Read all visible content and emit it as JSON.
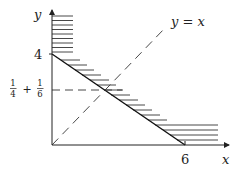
{
  "diagram": {
    "axes": {
      "x_label": "x",
      "y_label": "y"
    },
    "ticks": {
      "y_tick": "4",
      "x_tick": "6",
      "y_frac_label": {
        "num1": "1",
        "den1": "4",
        "plus": "+",
        "num2": "1",
        "den2": "6"
      }
    },
    "line_label": "y = x",
    "colors": {
      "stroke": "#222222",
      "hatch": "#333333",
      "background": "#ffffff"
    }
  }
}
